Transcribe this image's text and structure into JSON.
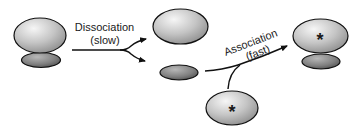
{
  "diagram": {
    "steps": [
      {
        "label": "Dissociation",
        "rate": "(slow)"
      },
      {
        "label": "Association",
        "rate": "(fast)"
      }
    ],
    "marker_symbol": "*",
    "colors": {
      "large_light": "#ececec",
      "large_dark": "#9c9c9c",
      "small_light": "#a8a8a8",
      "small_dark": "#5a5a5a",
      "stroke": "#111111",
      "arrow": "#111111"
    },
    "entities": [
      {
        "id": "complex-left",
        "parts": [
          "large-subunit",
          "small-subunit"
        ],
        "marked": false
      },
      {
        "id": "free-large-subunit",
        "marked": false
      },
      {
        "id": "free-small-subunit",
        "marked": false
      },
      {
        "id": "marked-large-subunit",
        "marked": true
      },
      {
        "id": "complex-right",
        "parts": [
          "marked-large-subunit",
          "small-subunit"
        ],
        "marked": true
      }
    ]
  }
}
